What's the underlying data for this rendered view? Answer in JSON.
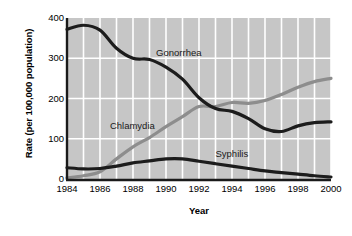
{
  "chart_data": {
    "type": "line",
    "title": "",
    "xlabel": "Year",
    "ylabel": "Rate (per 100,000 population)",
    "x": [
      1984,
      1985,
      1986,
      1987,
      1988,
      1989,
      1990,
      1991,
      1992,
      1993,
      1994,
      1995,
      1996,
      1997,
      1998,
      1999,
      2000
    ],
    "xtick_labels": [
      "1984",
      "1986",
      "1988",
      "1990",
      "1992",
      "1994",
      "1996",
      "1998",
      "2000"
    ],
    "xtick_values": [
      1984,
      1986,
      1988,
      1990,
      1992,
      1994,
      1996,
      1998,
      2000
    ],
    "ytick_labels": [
      "0",
      "100",
      "200",
      "300",
      "400"
    ],
    "ytick_values": [
      0,
      100,
      200,
      300,
      400
    ],
    "xlim": [
      1984,
      2000
    ],
    "ylim": [
      0,
      400
    ],
    "grid": true,
    "grid_color": "#ffffff",
    "plot_background": "#c6c6c6",
    "legend_position": "inline-annotations",
    "series": [
      {
        "name": "Gonorrhea",
        "color": "#1c1c1c",
        "label_x": 1989.4,
        "label_y": 312,
        "values": [
          372,
          382,
          370,
          325,
          300,
          297,
          278,
          248,
          202,
          175,
          168,
          150,
          125,
          118,
          132,
          140,
          142
        ]
      },
      {
        "name": "Chlamydia",
        "color": "#8d8d8d",
        "label_x": 1986.6,
        "label_y": 132,
        "values": [
          3,
          8,
          18,
          50,
          80,
          103,
          130,
          155,
          180,
          180,
          190,
          188,
          195,
          210,
          228,
          242,
          250
        ]
      },
      {
        "name": "Syphilis",
        "color": "#1c1c1c",
        "label_x": 1993.0,
        "label_y": 62,
        "values": [
          28,
          25,
          26,
          32,
          40,
          45,
          50,
          50,
          44,
          38,
          32,
          26,
          20,
          16,
          12,
          8,
          5
        ]
      }
    ]
  }
}
